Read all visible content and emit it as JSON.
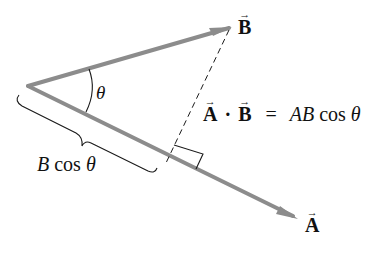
{
  "diagram": {
    "colors": {
      "vector": "#8c8c8c",
      "line": "#1a1a1a",
      "text": "#111111",
      "background": "#ffffff"
    },
    "vectors": {
      "A": {
        "label": "A",
        "arrow": "→"
      },
      "B": {
        "label": "B",
        "arrow": "→"
      }
    },
    "angle_label": "θ",
    "projection_label": {
      "B": "B",
      "cos": "cos",
      "theta": "θ"
    },
    "equation": {
      "lhs_a": "A",
      "lhs_arrow_a": "→",
      "dot": "·",
      "lhs_b": "B",
      "lhs_arrow_b": "→",
      "equals": "=",
      "rhs_ab": "AB",
      "rhs_cos": "cos",
      "rhs_theta": "θ"
    }
  }
}
